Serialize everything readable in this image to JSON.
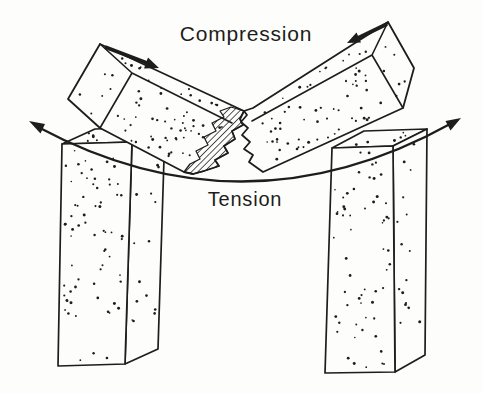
{
  "diagram": {
    "labels": {
      "compression": "Compression",
      "tension": "Tension"
    },
    "colors": {
      "ink": "#1d1d1b",
      "paper": "#fdfdfb"
    }
  }
}
